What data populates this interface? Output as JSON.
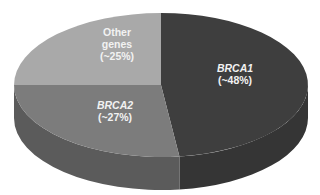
{
  "chart_data": {
    "type": "pie",
    "style": "3d",
    "title": "",
    "categories": [
      "BRCA1",
      "BRCA2",
      "Other genes"
    ],
    "values": [
      48,
      27,
      25
    ],
    "labels": [
      "BRCA1 (~48%)",
      "BRCA2 (~27%)",
      "Other genes (~25%)"
    ],
    "colors": [
      "#3e3e3e",
      "#7c7c7c",
      "#a9a9a9"
    ],
    "side_colors": [
      "#353535",
      "#5b5b5b",
      "#8a8a8a"
    ],
    "start_angle_deg": 0,
    "direction": "clockwise",
    "legend": "none"
  },
  "slices": [
    {
      "name": "BRCA1",
      "line1": "BRCA1",
      "line2": "(~48%)",
      "italic": true
    },
    {
      "name": "BRCA2",
      "line1": "BRCA2",
      "line2": "(~27%)",
      "italic": true
    },
    {
      "name": "Other genes",
      "line1": "Other",
      "line1b": "genes",
      "line2": "(~25%)",
      "italic": false
    }
  ]
}
